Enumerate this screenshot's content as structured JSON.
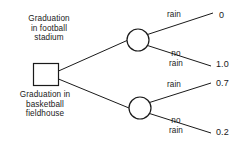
{
  "diagram": {
    "type": "decision-tree",
    "background_color": "#ffffff",
    "line_color": "#1a1a1a",
    "decision_node": {
      "shape": "square",
      "label_top": "Graduation\nin football\nstadium",
      "label_bottom": "Graduation in\nbasketball\nfieldhouse"
    },
    "chance_nodes": [
      {
        "id": "chance-football",
        "shape": "circle"
      },
      {
        "id": "chance-basketball",
        "shape": "circle"
      }
    ],
    "branches": [
      {
        "id": "rain-football",
        "label": "rain",
        "outcome": "0"
      },
      {
        "id": "norain-football",
        "label": "no\nrain",
        "outcome": "1.0"
      },
      {
        "id": "rain-basketball",
        "label": "rain",
        "outcome": "0.7"
      },
      {
        "id": "norain-basketball",
        "label": "no\nrain",
        "outcome": "0.2"
      }
    ]
  }
}
